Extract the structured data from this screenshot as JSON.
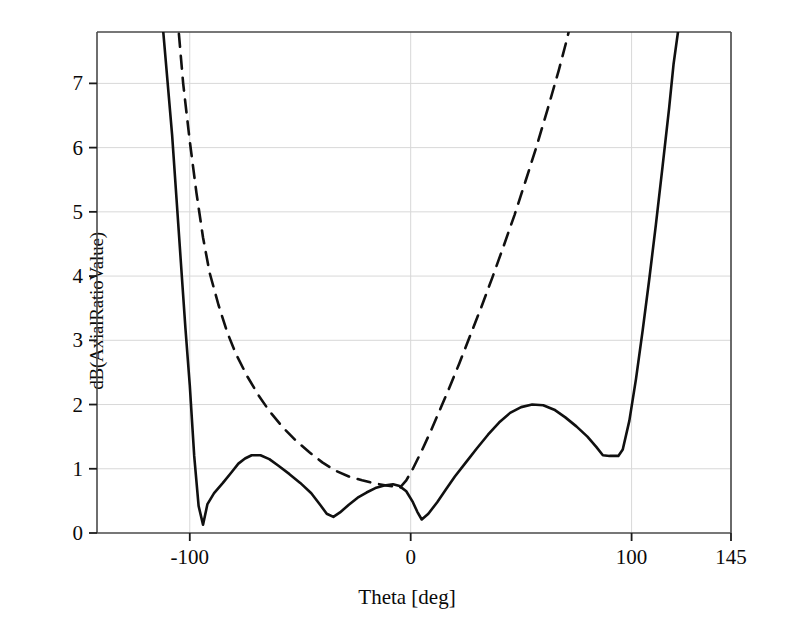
{
  "chart_data": {
    "type": "line",
    "title": "",
    "xlabel": "Theta [deg]",
    "ylabel": "dB(AxialRatioValue)",
    "xlim": [
      -142,
      145
    ],
    "ylim": [
      0,
      7.8
    ],
    "xticks": [
      -100,
      0,
      100,
      145
    ],
    "xtick_labels": [
      "-100",
      "0",
      "100",
      "145"
    ],
    "yticks": [
      0,
      1,
      2,
      3,
      4,
      5,
      6,
      7
    ],
    "ytick_labels": [
      "0",
      "1",
      "2",
      "3",
      "4",
      "5",
      "6",
      "7"
    ],
    "grid": true,
    "legend": "none",
    "series": [
      {
        "name": "solid-curve",
        "style": "solid",
        "color": "#101010",
        "points": [
          [
            -142,
            15.6
          ],
          [
            -130,
            12.2
          ],
          [
            -120,
            9.9
          ],
          [
            -115,
            8.6
          ],
          [
            -112,
            7.8
          ],
          [
            -110,
            7.0
          ],
          [
            -108,
            6.2
          ],
          [
            -106,
            5.2
          ],
          [
            -104,
            4.2
          ],
          [
            -102,
            3.2
          ],
          [
            -100,
            2.3
          ],
          [
            -98,
            1.2
          ],
          [
            -96,
            0.42
          ],
          [
            -94,
            0.13
          ],
          [
            -92,
            0.45
          ],
          [
            -89,
            0.62
          ],
          [
            -85,
            0.78
          ],
          [
            -81,
            0.95
          ],
          [
            -78,
            1.08
          ],
          [
            -75,
            1.16
          ],
          [
            -72,
            1.21
          ],
          [
            -68,
            1.21
          ],
          [
            -64,
            1.15
          ],
          [
            -60,
            1.05
          ],
          [
            -55,
            0.92
          ],
          [
            -50,
            0.78
          ],
          [
            -45,
            0.62
          ],
          [
            -41,
            0.44
          ],
          [
            -38,
            0.3
          ],
          [
            -35,
            0.25
          ],
          [
            -32,
            0.32
          ],
          [
            -28,
            0.44
          ],
          [
            -24,
            0.55
          ],
          [
            -20,
            0.63
          ],
          [
            -16,
            0.7
          ],
          [
            -12,
            0.74
          ],
          [
            -8,
            0.76
          ],
          [
            -5,
            0.73
          ],
          [
            -2,
            0.65
          ],
          [
            1,
            0.48
          ],
          [
            3,
            0.33
          ],
          [
            5,
            0.21
          ],
          [
            8,
            0.3
          ],
          [
            12,
            0.48
          ],
          [
            16,
            0.68
          ],
          [
            20,
            0.88
          ],
          [
            25,
            1.1
          ],
          [
            30,
            1.32
          ],
          [
            35,
            1.53
          ],
          [
            40,
            1.72
          ],
          [
            45,
            1.87
          ],
          [
            50,
            1.96
          ],
          [
            55,
            2.0
          ],
          [
            60,
            1.99
          ],
          [
            65,
            1.92
          ],
          [
            70,
            1.8
          ],
          [
            75,
            1.66
          ],
          [
            80,
            1.5
          ],
          [
            84,
            1.34
          ],
          [
            87,
            1.21
          ],
          [
            90,
            1.2
          ],
          [
            94,
            1.2
          ],
          [
            96,
            1.3
          ],
          [
            99,
            1.75
          ],
          [
            102,
            2.4
          ],
          [
            105,
            3.15
          ],
          [
            108,
            3.95
          ],
          [
            111,
            4.8
          ],
          [
            114,
            5.7
          ],
          [
            117,
            6.62
          ],
          [
            119,
            7.3
          ],
          [
            121,
            7.8
          ],
          [
            124,
            8.6
          ]
        ]
      },
      {
        "name": "dashed-curve",
        "style": "dashed",
        "color": "#101010",
        "points": [
          [
            -112,
            10.5
          ],
          [
            -108,
            9.2
          ],
          [
            -105,
            7.8
          ],
          [
            -103,
            7.0
          ],
          [
            -100,
            6.1
          ],
          [
            -97,
            5.3
          ],
          [
            -94,
            4.6
          ],
          [
            -91,
            4.05
          ],
          [
            -87,
            3.55
          ],
          [
            -83,
            3.12
          ],
          [
            -79,
            2.78
          ],
          [
            -74,
            2.44
          ],
          [
            -69,
            2.15
          ],
          [
            -64,
            1.9
          ],
          [
            -58,
            1.65
          ],
          [
            -52,
            1.44
          ],
          [
            -46,
            1.26
          ],
          [
            -40,
            1.1
          ],
          [
            -34,
            0.97
          ],
          [
            -28,
            0.88
          ],
          [
            -22,
            0.82
          ],
          [
            -16,
            0.77
          ],
          [
            -11,
            0.74
          ],
          [
            -7,
            0.72
          ],
          [
            -5,
            0.7
          ],
          [
            -2,
            0.82
          ],
          [
            1,
            1.0
          ],
          [
            5,
            1.28
          ],
          [
            9,
            1.58
          ],
          [
            13,
            1.9
          ],
          [
            17,
            2.22
          ],
          [
            22,
            2.64
          ],
          [
            27,
            3.08
          ],
          [
            32,
            3.52
          ],
          [
            37,
            3.98
          ],
          [
            42,
            4.46
          ],
          [
            47,
            4.95
          ],
          [
            52,
            5.48
          ],
          [
            57,
            6.02
          ],
          [
            62,
            6.6
          ],
          [
            67,
            7.2
          ],
          [
            71,
            7.72
          ],
          [
            74,
            8.2
          ]
        ]
      }
    ]
  },
  "axes": {
    "left_px": 97,
    "right_px": 731,
    "top_px": 32,
    "bottom_px": 533
  }
}
